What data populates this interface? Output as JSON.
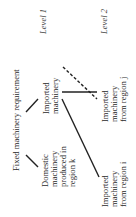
{
  "diagram": {
    "root": "Fixed machinery requirement",
    "levels": [
      "Level 1",
      "Level 2"
    ],
    "level1": {
      "domestic": [
        "Domestic",
        "machinery",
        "produced in",
        "region k"
      ],
      "imported": [
        "Imported",
        "machinery"
      ]
    },
    "level2": {
      "from_i": [
        "Imported",
        "machinery",
        "from region i"
      ],
      "from_j": [
        "Imported",
        "machinery",
        "from region j"
      ]
    },
    "colors": {
      "line": "#222222",
      "text": "#2a2a2a"
    }
  }
}
